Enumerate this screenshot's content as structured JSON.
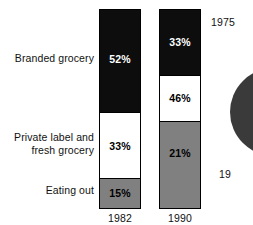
{
  "chart_data": {
    "type": "bar",
    "title": "",
    "subtitle": "",
    "xlabel": "",
    "ylabel": "",
    "ylim": [
      0,
      100
    ],
    "grid": false,
    "legend_position": "left-axis-labels",
    "stacked": true,
    "categories": [
      "1982",
      "1990"
    ],
    "series": [
      {
        "name": "Branded grocery",
        "values": [
          52,
          33
        ],
        "color": "#0d0d0d",
        "value_labels": [
          "52%",
          "33%"
        ]
      },
      {
        "name": "Private label and\nfresh grocery",
        "values": [
          33,
          46
        ],
        "color": "#ffffff",
        "value_labels": [
          "33%",
          "46%"
        ]
      },
      {
        "name": "Eating out",
        "values": [
          15,
          21
        ],
        "color": "#808080",
        "value_labels": [
          "15%",
          "21%"
        ]
      }
    ],
    "annotations": [
      "1975",
      "19"
    ]
  },
  "axis": {
    "category_labels": [
      {
        "id": "branded",
        "text": "Branded grocery"
      },
      {
        "id": "private",
        "text": "Private label and\nfresh grocery"
      },
      {
        "id": "eating",
        "text": "Eating out"
      }
    ],
    "year_labels": [
      {
        "id": "y1982",
        "text": "1982"
      },
      {
        "id": "y1990",
        "text": "1990"
      }
    ]
  },
  "bars": [
    {
      "year": "1982",
      "segments": [
        {
          "name": "Branded grocery",
          "label": "52%",
          "pct": 52,
          "fill": "black"
        },
        {
          "name": "Private label and fresh grocery",
          "label": "33%",
          "pct": 33,
          "fill": "white"
        },
        {
          "name": "Eating out",
          "label": "15%",
          "pct": 15,
          "fill": "gray"
        }
      ]
    },
    {
      "year": "1990",
      "segments": [
        {
          "name": "Branded grocery",
          "label": "33%",
          "pct": 33,
          "fill": "black"
        },
        {
          "name": "Private label and fresh grocery",
          "label": "46%",
          "pct": 46,
          "fill": "white"
        },
        {
          "name": "Eating out",
          "label": "21%",
          "pct": 21,
          "fill": "gray"
        }
      ]
    }
  ],
  "pie_partial": {
    "year_top": "1975",
    "year_bottom": "19",
    "fill": "#3a3a3a"
  },
  "colors": {
    "black_segment": "#0d0d0d",
    "white_segment": "#ffffff",
    "gray_segment": "#808080",
    "pie_fill": "#3a3a3a",
    "outline": "#000000",
    "background": "#ffffff"
  }
}
